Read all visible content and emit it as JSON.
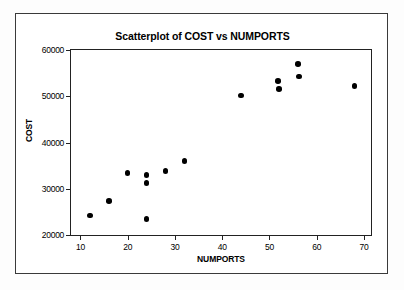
{
  "chart_data": {
    "type": "scatter",
    "title": "Scatterplot of COST vs NUMPORTS",
    "xlabel": "NUMPORTS",
    "ylabel": "COST",
    "xlim": [
      8,
      71.5
    ],
    "ylim": [
      20000,
      60000
    ],
    "grid": false,
    "legend": null,
    "xticks": [
      10,
      20,
      30,
      40,
      50,
      60,
      70
    ],
    "xtick_labels": [
      "10",
      "20",
      "30",
      "40",
      "50",
      "60",
      "70"
    ],
    "yticks": [
      20000,
      30000,
      40000,
      50000,
      60000
    ],
    "ytick_labels": [
      "20000",
      "30000",
      "40000",
      "50000",
      "60000"
    ],
    "marker": "filled-circle",
    "marker_color": "#000000",
    "points": [
      {
        "x": 12,
        "y": 24200
      },
      {
        "x": 16,
        "y": 27400
      },
      {
        "x": 20,
        "y": 33400
      },
      {
        "x": 24,
        "y": 33000
      },
      {
        "x": 24,
        "y": 31200
      },
      {
        "x": 24,
        "y": 23400
      },
      {
        "x": 28,
        "y": 33800
      },
      {
        "x": 32,
        "y": 36000
      },
      {
        "x": 44,
        "y": 50200
      },
      {
        "x": 51.8,
        "y": 53300
      },
      {
        "x": 52,
        "y": 51600
      },
      {
        "x": 56,
        "y": 57000
      },
      {
        "x": 56.2,
        "y": 54300
      },
      {
        "x": 68,
        "y": 52200
      }
    ]
  },
  "colors": {
    "axis": "#222222",
    "outer_border": "#3a3a3a",
    "background": "#ffffff",
    "marker": "#000000"
  }
}
